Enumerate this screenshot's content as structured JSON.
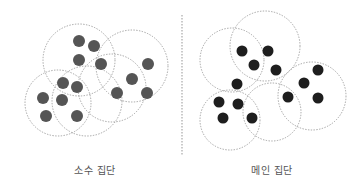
{
  "colors": {
    "background": "#ffffff",
    "circle_stroke": "#9a9a9a",
    "divider": "#a8a8a8",
    "minority_dot": "#555555",
    "main_dot": "#1e1e1e",
    "label": "#555555"
  },
  "divider": {
    "x": 182,
    "y1": 15,
    "y2": 155
  },
  "panels": [
    {
      "id": "minority",
      "label": "소수 집단",
      "dot_radius": 6,
      "circles": [
        {
          "cx": 79,
          "cy": 60,
          "r": 36
        },
        {
          "cx": 132,
          "cy": 66,
          "r": 36
        },
        {
          "cx": 112,
          "cy": 88,
          "r": 34
        },
        {
          "cx": 58,
          "cy": 103,
          "r": 33
        },
        {
          "cx": 87,
          "cy": 101,
          "r": 35
        }
      ],
      "dots": [
        {
          "x": 79,
          "y": 41
        },
        {
          "x": 94,
          "y": 46
        },
        {
          "x": 79,
          "y": 60
        },
        {
          "x": 101,
          "y": 64
        },
        {
          "x": 63,
          "y": 83
        },
        {
          "x": 77,
          "y": 87
        },
        {
          "x": 43,
          "y": 98
        },
        {
          "x": 62,
          "y": 100
        },
        {
          "x": 46,
          "y": 116
        },
        {
          "x": 77,
          "y": 116
        },
        {
          "x": 148,
          "y": 64
        },
        {
          "x": 132,
          "y": 79
        },
        {
          "x": 117,
          "y": 93
        },
        {
          "x": 147,
          "y": 93
        }
      ]
    },
    {
      "id": "main",
      "label": "메인 집단",
      "dot_radius": 5.5,
      "circles": [
        {
          "cx": 232,
          "cy": 60,
          "r": 32
        },
        {
          "cx": 265,
          "cy": 46,
          "r": 35
        },
        {
          "cx": 312,
          "cy": 96,
          "r": 34
        },
        {
          "cx": 230,
          "cy": 120,
          "r": 30
        },
        {
          "cx": 272,
          "cy": 112,
          "r": 29
        }
      ],
      "dots": [
        {
          "x": 242,
          "y": 51
        },
        {
          "x": 268,
          "y": 51
        },
        {
          "x": 254,
          "y": 65
        },
        {
          "x": 276,
          "y": 70
        },
        {
          "x": 237,
          "y": 84
        },
        {
          "x": 219,
          "y": 102
        },
        {
          "x": 238,
          "y": 104
        },
        {
          "x": 223,
          "y": 118
        },
        {
          "x": 252,
          "y": 118
        },
        {
          "x": 288,
          "y": 97
        },
        {
          "x": 304,
          "y": 83
        },
        {
          "x": 318,
          "y": 70
        },
        {
          "x": 318,
          "y": 98
        }
      ]
    }
  ]
}
